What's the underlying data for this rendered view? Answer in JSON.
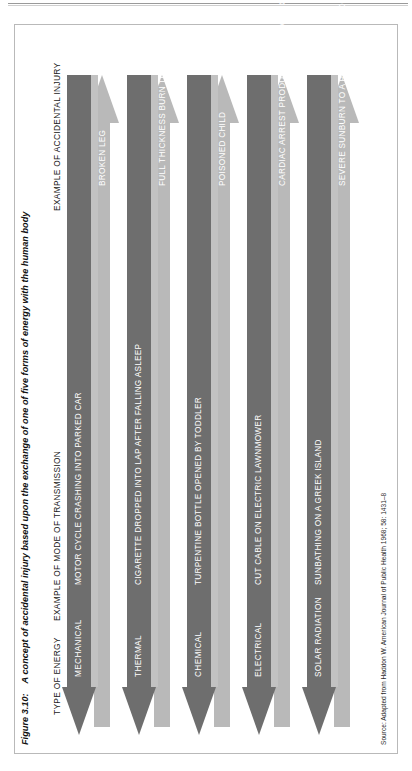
{
  "figure": {
    "number": "Figure 3.10:",
    "caption": "A concept of accidental injury based upon the exchange of one of five forms of energy with the human body",
    "source": "Source: Adapted from Haddon W. American Journal of Public Health 1968; 58: 1431–8"
  },
  "headers": {
    "energy": "TYPE OF ENERGY",
    "transmission": "EXAMPLE OF MODE OF TRANSMISSION",
    "injury": "EXAMPLE OF ACCIDENTAL INJURY"
  },
  "colors": {
    "dark_arrow": "#6e6e6e",
    "light_arrow": "#b9b9b9",
    "shadow": "#c2c2c2",
    "frame": "#b9b9b9",
    "label_text": "#ffffff",
    "body_text": "#1a1a1a"
  },
  "rows": [
    {
      "energy": "MECHANICAL",
      "transmission": "MOTOR CYCLE CRASHING INTO PARKED CAR",
      "injury": "BROKEN LEG"
    },
    {
      "energy": "THERMAL",
      "transmission": "CIGARETTE DROPPED INTO LAP AFTER FALLING ASLEEP",
      "injury": "FULL THICKNESS BURN TO THIGH"
    },
    {
      "energy": "CHEMICAL",
      "transmission": "TURPENTINE BOTTLE OPENED BY TODDLER",
      "injury": "POISONED CHILD"
    },
    {
      "energy": "ELECTRICAL",
      "transmission": "CUT CABLE ON ELECTRIC LAWNMOWER",
      "injury": "CARDIAC ARREST PRODUCED BY ELECTRIC SHOCK"
    },
    {
      "energy": "SOLAR RADIATION",
      "transmission": "SUNBATHING ON A GREEK ISLAND",
      "injury": "SEVERE SUNBURN TO A PALE-SKINNED HOLIDAYMAKER"
    }
  ]
}
